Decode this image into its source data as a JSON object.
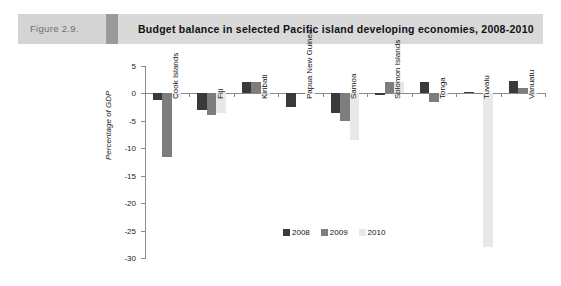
{
  "header": {
    "figure_number": "Figure 2.9.",
    "title": "Budget balance in selected Pacific island developing economies, 2008-2010"
  },
  "colors": {
    "series_2008": "#3a3a3a",
    "series_2009": "#7d7d7d",
    "series_2010": "#e8e8e8",
    "banner_left": "#d4d4d4",
    "banner_wedge": "#9a9a9a",
    "banner_right": "#d9d9d9",
    "axis": "#8a8a8a"
  },
  "chart_data": {
    "type": "bar",
    "title": "Budget balance in selected Pacific island developing economies, 2008-2010",
    "xlabel": "",
    "ylabel": "Percentage of GDP",
    "ylim": [
      -30,
      5
    ],
    "yticks": [
      5,
      0,
      -5,
      -10,
      -15,
      -20,
      -25,
      -30
    ],
    "ytick_labels": [
      "5",
      "0",
      "-5",
      "-10",
      "-15",
      "-20",
      "-25",
      "-30"
    ],
    "grid": false,
    "legend_position": "bottom-center",
    "categories": [
      "Cook Islands",
      "Fiji",
      "Kiribati",
      "Papua New Guinea",
      "Samoa",
      "Solomon Islands",
      "Tonga",
      "Tuvalu",
      "Vanuatu"
    ],
    "series": [
      {
        "name": "2008",
        "color": "#3a3a3a",
        "values": [
          -1.2,
          -3.0,
          2.0,
          -2.5,
          -3.5,
          -0.3,
          2.0,
          0.2,
          2.3
        ]
      },
      {
        "name": "2009",
        "color": "#7d7d7d",
        "values": [
          -11.5,
          -4.0,
          2.0,
          0.0,
          -5.0,
          2.0,
          -1.5,
          0.0,
          1.0
        ]
      },
      {
        "name": "2010",
        "color": "#e8e8e8",
        "values": [
          -0.6,
          -3.5,
          -0.4,
          0.0,
          -8.5,
          2.0,
          -0.5,
          -28.0,
          -0.2
        ]
      }
    ]
  },
  "legend": {
    "items": [
      {
        "label": "2008",
        "color": "#3a3a3a"
      },
      {
        "label": "2009",
        "color": "#7d7d7d"
      },
      {
        "label": "2010",
        "color": "#e8e8e8"
      }
    ]
  }
}
